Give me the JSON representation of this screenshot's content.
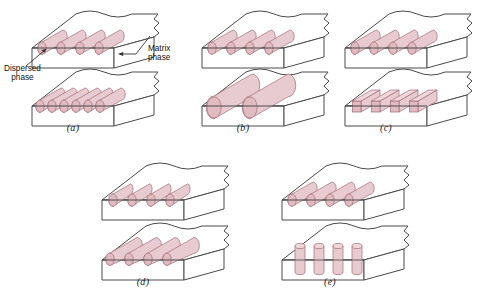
{
  "figure": {
    "background_color": "#ffffff",
    "fiber_fill": "#e6c6cb",
    "fiber_fill_light": "#eed6da",
    "fiber_stroke": "#a36b74",
    "block_stroke": "#4a4a4a",
    "text_color": "#111111"
  },
  "annotations": {
    "matrix": {
      "line1": "Matrix",
      "line2": "phase"
    },
    "dispersed": {
      "line1": "Dispersed",
      "line2": "phase"
    }
  },
  "panels": [
    {
      "id": "a",
      "caption": "(a)",
      "top_block": {
        "fiber_count": 4,
        "fiber_shape": "cylinder",
        "fiber_orientation": "aligned-diagonal",
        "fiber_size": "medium",
        "spacing": "wide"
      },
      "bottom_block": {
        "fiber_count": 6,
        "fiber_shape": "cylinder",
        "fiber_orientation": "aligned-diagonal",
        "fiber_size": "medium",
        "spacing": "dense"
      },
      "variable": "concentration"
    },
    {
      "id": "b",
      "caption": "(b)",
      "top_block": {
        "fiber_count": 4,
        "fiber_shape": "cylinder",
        "fiber_orientation": "aligned-diagonal",
        "fiber_size": "medium",
        "spacing": "wide"
      },
      "bottom_block": {
        "fiber_count": 2,
        "fiber_shape": "cylinder",
        "fiber_orientation": "aligned-diagonal",
        "fiber_size": "large",
        "spacing": "wide"
      },
      "variable": "size"
    },
    {
      "id": "c",
      "caption": "(c)",
      "top_block": {
        "fiber_count": 4,
        "fiber_shape": "cylinder",
        "fiber_orientation": "aligned-diagonal",
        "fiber_size": "medium",
        "spacing": "wide"
      },
      "bottom_block": {
        "fiber_count": 4,
        "fiber_shape": "square-bar",
        "fiber_orientation": "aligned-diagonal",
        "fiber_size": "medium",
        "spacing": "wide"
      },
      "variable": "shape"
    },
    {
      "id": "d",
      "caption": "(d)",
      "top_block": {
        "fiber_count": 4,
        "fiber_shape": "cylinder",
        "fiber_orientation": "aligned-diagonal",
        "fiber_size": "short",
        "spacing": "wide"
      },
      "bottom_block": {
        "fiber_count": 4,
        "fiber_shape": "cylinder",
        "fiber_orientation": "aligned-diagonal",
        "fiber_size": "long",
        "spacing": "wide"
      },
      "variable": "distribution"
    },
    {
      "id": "e",
      "caption": "(e)",
      "top_block": {
        "fiber_count": 4,
        "fiber_shape": "cylinder",
        "fiber_orientation": "aligned-diagonal",
        "fiber_size": "medium",
        "spacing": "wide"
      },
      "bottom_block": {
        "fiber_count": 4,
        "fiber_shape": "cylinder",
        "fiber_orientation": "vertical",
        "fiber_size": "medium",
        "spacing": "wide"
      },
      "variable": "orientation"
    }
  ]
}
